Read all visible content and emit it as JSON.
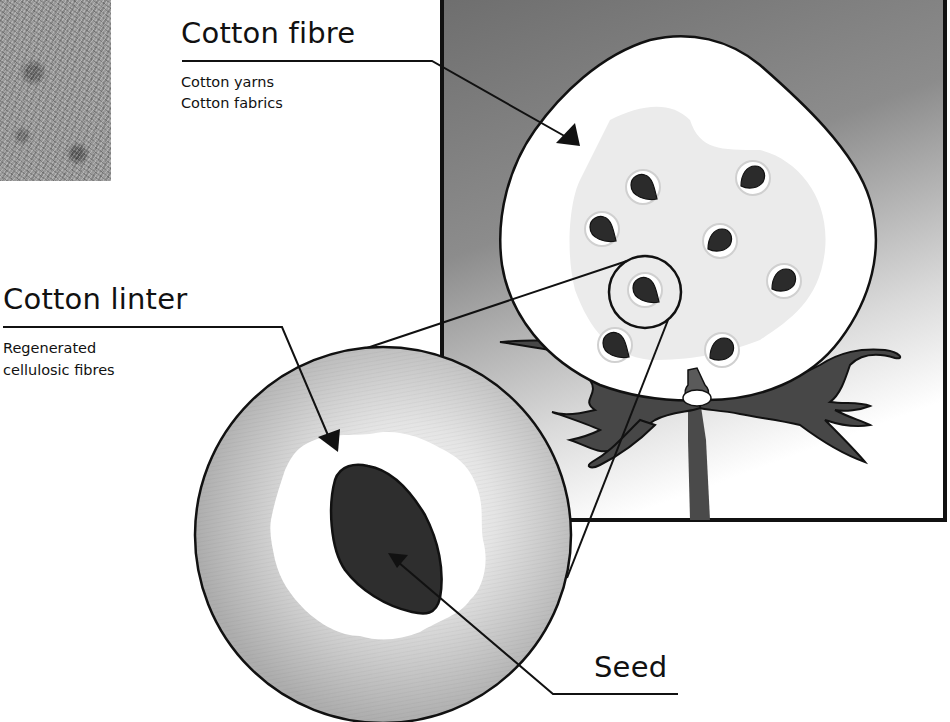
{
  "diagram": {
    "colors": {
      "frame_gradient_top": "#6f6f6f",
      "frame_gradient_bottom": "#ffffff",
      "boll": "#ffffff",
      "boll_shadow": "#e9e9e9",
      "seed": "#2b2b2b",
      "bract": "#4a4a4a",
      "outline": "#111111",
      "magnifier_outer": "#b5b5b5",
      "magnifier_inner": "#f2f2f2"
    },
    "labels": {
      "cotton_fibre": {
        "heading": "Cotton fibre",
        "uses": [
          "Cotton yarns",
          "Cotton fabrics"
        ]
      },
      "cotton_linter": {
        "heading": "Cotton linter",
        "uses": [
          "Regenerated",
          "cellulosic fibres"
        ]
      },
      "seed": {
        "heading": "Seed"
      }
    },
    "elements": {
      "photo_swatch": "cotton fibre texture photo",
      "boll_seed_count": 8,
      "magnifier": "enlarged view of a single seed with linter"
    }
  }
}
